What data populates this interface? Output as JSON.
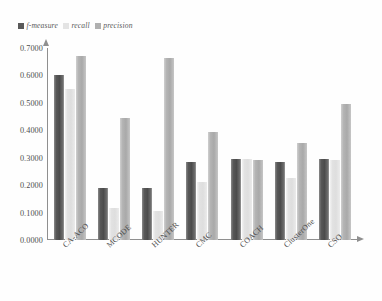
{
  "chart_data": {
    "type": "bar",
    "title": "",
    "xlabel": "",
    "ylabel": "",
    "ylim": [
      0.0,
      0.7
    ],
    "grid": false,
    "legend_position": "top-left",
    "categories": [
      "CA-ACO",
      "MCODE",
      "HUNTER",
      "CMC",
      "COACH",
      "ClusterOne",
      "CSO"
    ],
    "ytick_labels": [
      "0.7000",
      "0.6000",
      "0.5000",
      "0.4000",
      "0.3000",
      "0.2000",
      "0.1000",
      "0.0000"
    ],
    "ytick_values": [
      0.7,
      0.6,
      0.5,
      0.4,
      0.3,
      0.2,
      0.1,
      0.0
    ],
    "series": [
      {
        "name": "f-measure",
        "color": "#595959",
        "values": [
          0.6,
          0.19,
          0.19,
          0.285,
          0.295,
          0.285,
          0.295
        ]
      },
      {
        "name": "recall",
        "color": "#e4e4e4",
        "values": [
          0.55,
          0.115,
          0.105,
          0.21,
          0.295,
          0.225,
          0.29
        ]
      },
      {
        "name": "precision",
        "color": "#b0b0b0",
        "values": [
          0.67,
          0.445,
          0.665,
          0.395,
          0.29,
          0.355,
          0.495
        ]
      }
    ]
  },
  "legend": {
    "items": [
      {
        "label": "f-measure",
        "color": "#595959"
      },
      {
        "label": "recall",
        "color": "#e4e4e4"
      },
      {
        "label": "precision",
        "color": "#b0b0b0"
      }
    ]
  }
}
